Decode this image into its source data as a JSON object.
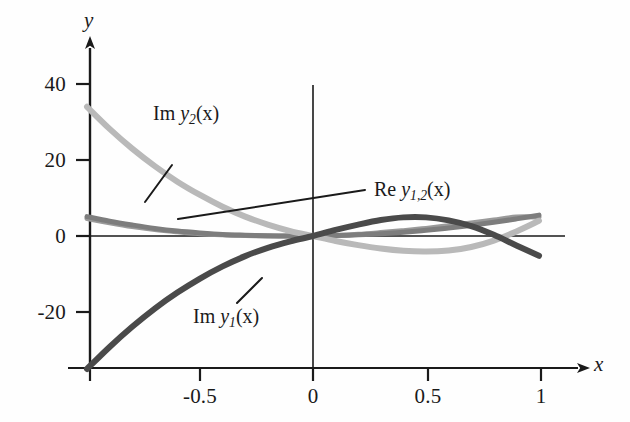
{
  "figure": {
    "background": "#fefefe",
    "axis_color": "#1a1a1a"
  },
  "axes": {
    "x_axis_name": "x",
    "y_axis_name": "y",
    "x_ticks": [
      "-0.5",
      "0",
      "0.5",
      "1"
    ],
    "y_ticks": [
      "40",
      "20",
      "0",
      "-20"
    ]
  },
  "labels": {
    "im_y2": {
      "prefix": "Im ",
      "sym": "y",
      "sub": "2",
      "arg": "(x)"
    },
    "im_y1": {
      "prefix": "Im ",
      "sym": "y",
      "sub": "1",
      "arg": "(x)"
    },
    "re_y12": {
      "prefix": "Re ",
      "sym": "y",
      "sub": "1,2",
      "arg": "(x)"
    }
  },
  "chart_data": {
    "type": "line",
    "title": "",
    "xlabel": "x",
    "ylabel": "y",
    "xlim": [
      -1.0,
      1.1
    ],
    "ylim": [
      -36,
      46
    ],
    "xticks": [
      -0.5,
      0,
      0.5,
      1
    ],
    "yticks": [
      40,
      20,
      0,
      -20
    ],
    "grid": false,
    "legend": "inline-annotations",
    "annotations": [
      {
        "text": "Im y_2(x)",
        "x": -0.68,
        "y": 29,
        "leader_to": {
          "x": -0.86,
          "y": 19
        }
      },
      {
        "text": "Re y_1,2(x)",
        "x": 0.22,
        "y": 11,
        "leader_to": {
          "x": -0.6,
          "y": 3
        }
      },
      {
        "text": "Im y_1(x)",
        "x": -0.55,
        "y": -22,
        "leader_to": {
          "x": -0.38,
          "y": -13
        }
      }
    ],
    "x": [
      -1.0,
      -0.9,
      -0.8,
      -0.7,
      -0.6,
      -0.5,
      -0.4,
      -0.3,
      -0.2,
      -0.1,
      0.0,
      0.1,
      0.2,
      0.3,
      0.4,
      0.5,
      0.6,
      0.7,
      0.8,
      0.9,
      1.0
    ],
    "series": [
      {
        "name": "Im y_2(x)",
        "color": "#b9b9b9",
        "width": 6,
        "values": [
          34.0,
          28.2,
          23.0,
          18.4,
          14.3,
          10.8,
          7.7,
          5.1,
          3.0,
          1.3,
          0.0,
          -1.3,
          -2.4,
          -3.3,
          -3.9,
          -4.1,
          -3.8,
          -2.9,
          -1.2,
          1.2,
          4.0
        ]
      },
      {
        "name": "Im y_1(x)",
        "color": "#4a4a4a",
        "width": 6,
        "values": [
          -35.0,
          -29.2,
          -23.9,
          -19.1,
          -14.9,
          -11.2,
          -8.0,
          -5.3,
          -3.1,
          -1.4,
          0.0,
          1.6,
          3.0,
          4.2,
          4.9,
          4.9,
          4.1,
          2.6,
          0.3,
          -2.5,
          -5.2
        ]
      },
      {
        "name": "Re y_1(x)",
        "color": "#7d7d7d",
        "width": 5,
        "values": [
          5.1,
          3.9,
          2.9,
          2.0,
          1.3,
          0.8,
          0.4,
          0.2,
          0.05,
          0.0,
          0.0,
          0.1,
          0.3,
          0.6,
          1.0,
          1.5,
          2.1,
          2.8,
          3.6,
          4.5,
          5.5
        ]
      },
      {
        "name": "Re y_2(x)",
        "color": "#9a9a9a",
        "width": 5,
        "values": [
          4.6,
          3.5,
          2.5,
          1.7,
          1.1,
          0.6,
          0.3,
          0.1,
          0.0,
          0.0,
          0.0,
          0.15,
          0.45,
          0.9,
          1.4,
          2.0,
          2.7,
          3.4,
          4.2,
          5.0,
          5.0
        ]
      }
    ]
  }
}
